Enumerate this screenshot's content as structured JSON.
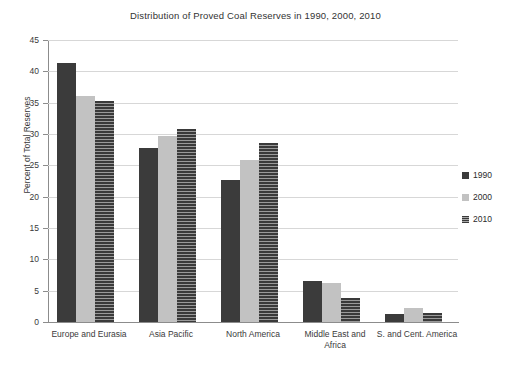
{
  "chart_data": {
    "type": "bar",
    "title": "Distribution of Proved Coal Reserves in 1990, 2000, 2010",
    "xlabel": "",
    "ylabel": "Percent of Total Reserves",
    "ylim": [
      0,
      45
    ],
    "ytick_step": 5,
    "yticks": [
      0,
      5,
      10,
      15,
      20,
      25,
      30,
      35,
      40,
      45
    ],
    "grid": true,
    "legend_position": "right",
    "categories": [
      "Europe and Eurasia",
      "Asia Pacific",
      "North America",
      "Middle East and Africa",
      "S. and Cent. America"
    ],
    "category_lines": [
      [
        "Europe and Eurasia"
      ],
      [
        "Asia Pacific"
      ],
      [
        "North America"
      ],
      [
        "Middle East and",
        "Africa"
      ],
      [
        "S. and Cent. America"
      ]
    ],
    "series": [
      {
        "name": "1990",
        "color": "#3b3b3b",
        "pattern": "solid",
        "values": [
          41.3,
          27.8,
          22.7,
          6.5,
          1.3
        ]
      },
      {
        "name": "2000",
        "color": "#c2c2c2",
        "pattern": "solid",
        "values": [
          36.0,
          29.7,
          25.9,
          6.3,
          2.2
        ]
      },
      {
        "name": "2010",
        "color": "#4a4a4a",
        "pattern": "horizontal-stripe",
        "values": [
          35.3,
          30.8,
          28.5,
          3.8,
          1.4
        ]
      }
    ]
  },
  "legend": {
    "items": [
      {
        "label": "1990"
      },
      {
        "label": "2000"
      },
      {
        "label": "2010"
      }
    ]
  },
  "colors": {
    "background": "#ffffff",
    "axis": "#8c8c8c",
    "gridline": "#d7d7d7",
    "text": "#2b2b2b",
    "series_1990": "#3b3b3b",
    "series_2000": "#c2c2c2",
    "series_2010": "#4a4a4a"
  }
}
